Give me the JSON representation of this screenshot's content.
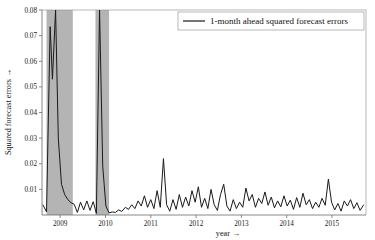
{
  "chart_data": {
    "type": "line",
    "title": "",
    "xlabel": "year →",
    "ylabel": "Squared forecast errors →",
    "xlim": [
      2008.6,
      2015.75
    ],
    "ylim": [
      0,
      0.08
    ],
    "ytick_values": [
      0.01,
      0.02,
      0.03,
      0.04,
      0.05,
      0.06,
      0.07,
      0.08
    ],
    "ytick_labels": [
      "0.01",
      "0.02",
      "0.03",
      "0.04",
      "0.05",
      "0.06",
      "0.07",
      "0.08"
    ],
    "xtick_values": [
      2009,
      2010,
      2011,
      2012,
      2013,
      2014,
      2015
    ],
    "xtick_labels": [
      "2009",
      "2010",
      "2011",
      "2012",
      "2013",
      "2014",
      "2015"
    ],
    "grid": false,
    "legend": {
      "position": "top-right",
      "entries": [
        {
          "name": "1-month ahead squared forecast errors",
          "color": "#1a1a1a",
          "marker": "line"
        }
      ]
    },
    "shaded_regions": [
      {
        "name": "recession-band-1",
        "x0": 2008.7,
        "x1": 2009.28,
        "color": "#b4b4b4"
      },
      {
        "name": "recession-band-2",
        "x0": 2009.78,
        "x1": 2010.08,
        "color": "#b4b4b4"
      }
    ],
    "series": [
      {
        "name": "1-month ahead squared forecast errors",
        "color": "#1a1a1a",
        "clipped_above": 0.08,
        "x": [
          2008.62,
          2008.7,
          2008.78,
          2008.83,
          2008.9,
          2008.96,
          2009.03,
          2009.1,
          2009.17,
          2009.24,
          2009.31,
          2009.38,
          2009.45,
          2009.52,
          2009.59,
          2009.66,
          2009.73,
          2009.8,
          2009.87,
          2009.94,
          2010.01,
          2010.08,
          2010.15,
          2010.22,
          2010.29,
          2010.36,
          2010.44,
          2010.51,
          2010.58,
          2010.65,
          2010.72,
          2010.79,
          2010.86,
          2010.93,
          2011.0,
          2011.07,
          2011.14,
          2011.21,
          2011.28,
          2011.35,
          2011.42,
          2011.49,
          2011.56,
          2011.63,
          2011.7,
          2011.77,
          2011.84,
          2011.91,
          2011.98,
          2012.05,
          2012.12,
          2012.19,
          2012.26,
          2012.33,
          2012.4,
          2012.47,
          2012.54,
          2012.61,
          2012.68,
          2012.75,
          2012.82,
          2012.89,
          2012.96,
          2013.03,
          2013.1,
          2013.17,
          2013.24,
          2013.31,
          2013.38,
          2013.45,
          2013.52,
          2013.59,
          2013.66,
          2013.73,
          2013.8,
          2013.87,
          2013.94,
          2014.01,
          2014.08,
          2014.15,
          2014.22,
          2014.29,
          2014.36,
          2014.43,
          2014.5,
          2014.57,
          2014.64,
          2014.71,
          2014.78,
          2014.85,
          2014.92,
          2014.99,
          2015.06,
          2015.13,
          2015.2,
          2015.27,
          2015.34,
          2015.41,
          2015.48,
          2015.55,
          2015.62,
          2015.7
        ],
        "y": [
          0.004,
          0.0012,
          0.0735,
          0.053,
          0.086,
          0.03,
          0.012,
          0.008,
          0.006,
          0.0048,
          0.0042,
          0.001,
          0.005,
          0.002,
          0.0055,
          0.0018,
          0.0052,
          0.0006,
          0.087,
          0.019,
          0.0035,
          0.0008,
          0.0012,
          0.001,
          0.002,
          0.0014,
          0.003,
          0.0022,
          0.004,
          0.0025,
          0.0055,
          0.0035,
          0.0075,
          0.003,
          0.006,
          0.0025,
          0.0095,
          0.003,
          0.022,
          0.004,
          0.0015,
          0.006,
          0.0022,
          0.008,
          0.003,
          0.007,
          0.0035,
          0.0095,
          0.005,
          0.011,
          0.003,
          0.0065,
          0.0025,
          0.01,
          0.004,
          0.0018,
          0.008,
          0.012,
          0.0035,
          0.0015,
          0.006,
          0.0025,
          0.005,
          0.003,
          0.0105,
          0.0055,
          0.008,
          0.003,
          0.0065,
          0.0045,
          0.009,
          0.0038,
          0.007,
          0.0028,
          0.0055,
          0.0032,
          0.0075,
          0.0035,
          0.0058,
          0.0022,
          0.0068,
          0.003,
          0.0085,
          0.004,
          0.006,
          0.0025,
          0.005,
          0.003,
          0.0065,
          0.0038,
          0.014,
          0.005,
          0.002,
          0.0045,
          0.0015,
          0.0055,
          0.0035,
          0.006,
          0.0025,
          0.0048,
          0.0018,
          0.004
        ]
      }
    ]
  }
}
